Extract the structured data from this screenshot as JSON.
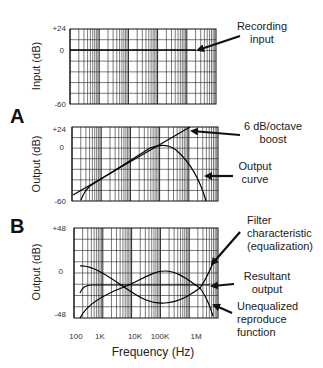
{
  "figure": {
    "panel_a_label": "A",
    "panel_b_label": "B",
    "x_axis": {
      "label": "Frequency (Hz)",
      "ticks": [
        "100",
        "1K",
        "10K",
        "100K",
        "1M"
      ]
    }
  },
  "panels": [
    {
      "id": "input",
      "ylabel": "Input (dB)",
      "yticks": [
        "+24",
        "0",
        "-60"
      ],
      "annotations": [
        {
          "line1": "Recording",
          "line2": "input"
        }
      ]
    },
    {
      "id": "output-a",
      "ylabel": "Output (dB)",
      "yticks": [
        "+24",
        "0",
        "-60"
      ],
      "annotations": [
        {
          "line1": "6 dB/octave",
          "line2": "boost"
        },
        {
          "line1": "Output",
          "line2": "curve"
        }
      ]
    },
    {
      "id": "output-b",
      "ylabel": "Output (dB)",
      "yticks": [
        "+48",
        "0",
        "-48"
      ],
      "annotations": [
        {
          "line1": "Filter",
          "line2": "characteristic",
          "line3": "(equalization)"
        },
        {
          "line1": "Resultant",
          "line2": "output"
        },
        {
          "line1": "Unequalized",
          "line2": "reproduce",
          "line3": "function"
        }
      ]
    }
  ],
  "chart_data": [
    {
      "type": "line",
      "title": "Recording input",
      "xlabel": "Frequency (Hz)",
      "ylabel": "Input (dB)",
      "x_scale": "log",
      "x": [
        100,
        1000,
        10000,
        100000,
        1000000,
        5000000
      ],
      "series": [
        {
          "name": "Recording input",
          "values": [
            0,
            0,
            0,
            0,
            0,
            0
          ]
        }
      ],
      "ylim": [
        -60,
        24
      ],
      "grid": true
    },
    {
      "type": "line",
      "title": "A",
      "xlabel": "Frequency (Hz)",
      "ylabel": "Output (dB)",
      "x_scale": "log",
      "x": [
        100,
        1000,
        10000,
        100000,
        300000,
        1000000,
        2000000
      ],
      "series": [
        {
          "name": "6 dB/octave boost",
          "values": [
            -54,
            -34,
            -14,
            4,
            14,
            24,
            30
          ]
        },
        {
          "name": "Output curve",
          "values": [
            -58,
            -34,
            -14,
            0,
            -2,
            -25,
            -60
          ]
        }
      ],
      "ylim": [
        -60,
        24
      ],
      "grid": true
    },
    {
      "type": "line",
      "title": "B",
      "xlabel": "Frequency (Hz)",
      "ylabel": "Output (dB)",
      "x_scale": "log",
      "x": [
        100,
        1000,
        5000,
        10000,
        100000,
        1000000,
        2000000
      ],
      "series": [
        {
          "name": "Filter characteristic (equalization)",
          "values": [
            4,
            -6,
            -20,
            -26,
            -34,
            -20,
            8
          ]
        },
        {
          "name": "Resultant output",
          "values": [
            -24,
            -20,
            -20,
            -20,
            -20,
            -20,
            -20
          ]
        },
        {
          "name": "Unequalized reproduce function",
          "values": [
            -48,
            -34,
            -20,
            -12,
            0,
            -20,
            -44
          ]
        }
      ],
      "ylim": [
        -48,
        48
      ],
      "grid": true
    }
  ]
}
